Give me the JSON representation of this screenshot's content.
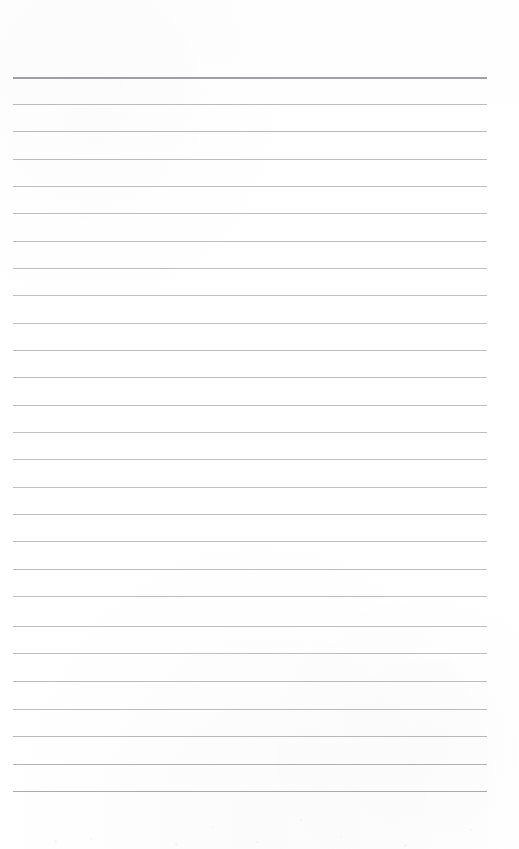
{
  "document": {
    "kind": "ruled-notebook-page",
    "title": "Blank ruled page",
    "text_content": "",
    "page_width": 519,
    "page_height": 849,
    "background_color": "#ffffff",
    "rule_color": "#b9bcc0",
    "header_rule_color": "#9ea2a7",
    "rule_left_x": 13,
    "rule_right_x": 487,
    "rule_count": 27,
    "rule_spacing": 27.4,
    "first_rule_y": 77,
    "last_rule_y": 791,
    "bottom_margin_height": 58,
    "rules": [
      {
        "index": 1,
        "y": 77,
        "weight": 2,
        "color": "#9ea2a7",
        "left": 13,
        "right": 487
      },
      {
        "index": 2,
        "y": 104,
        "weight": 1,
        "color": "#b9bcc0",
        "left": 13,
        "right": 487
      },
      {
        "index": 3,
        "y": 131,
        "weight": 1,
        "color": "#b9bcc0",
        "left": 13,
        "right": 487
      },
      {
        "index": 4,
        "y": 159,
        "weight": 1,
        "color": "#b9bcc0",
        "left": 13,
        "right": 487
      },
      {
        "index": 5,
        "y": 186,
        "weight": 1,
        "color": "#bcbfc3",
        "left": 13,
        "right": 487
      },
      {
        "index": 6,
        "y": 213,
        "weight": 1,
        "color": "#bcbfc3",
        "left": 13,
        "right": 487
      },
      {
        "index": 7,
        "y": 241,
        "weight": 1,
        "color": "#bcbfc3",
        "left": 13,
        "right": 487
      },
      {
        "index": 8,
        "y": 268,
        "weight": 1,
        "color": "#bcbfc3",
        "left": 13,
        "right": 487
      },
      {
        "index": 9,
        "y": 295,
        "weight": 1,
        "color": "#bcbfc3",
        "left": 13,
        "right": 487
      },
      {
        "index": 10,
        "y": 323,
        "weight": 1,
        "color": "#bcbfc3",
        "left": 13,
        "right": 487
      },
      {
        "index": 11,
        "y": 350,
        "weight": 1,
        "color": "#bcbfc3",
        "left": 13,
        "right": 487
      },
      {
        "index": 12,
        "y": 377,
        "weight": 1,
        "color": "#bcbfc3",
        "left": 13,
        "right": 487
      },
      {
        "index": 13,
        "y": 405,
        "weight": 1,
        "color": "#bcbfc3",
        "left": 13,
        "right": 487
      },
      {
        "index": 14,
        "y": 432,
        "weight": 1,
        "color": "#bcbfc3",
        "left": 13,
        "right": 487
      },
      {
        "index": 15,
        "y": 459,
        "weight": 1,
        "color": "#bcbfc3",
        "left": 13,
        "right": 487
      },
      {
        "index": 16,
        "y": 487,
        "weight": 1,
        "color": "#bcbfc3",
        "left": 13,
        "right": 487
      },
      {
        "index": 17,
        "y": 514,
        "weight": 1,
        "color": "#bcbfc3",
        "left": 13,
        "right": 487
      },
      {
        "index": 18,
        "y": 541,
        "weight": 1,
        "color": "#bcbfc3",
        "left": 13,
        "right": 487
      },
      {
        "index": 19,
        "y": 569,
        "weight": 1,
        "color": "#bcbfc3",
        "left": 13,
        "right": 487
      },
      {
        "index": 20,
        "y": 596,
        "weight": 1,
        "color": "#bcbfc3",
        "left": 13,
        "right": 487
      },
      {
        "index": 21,
        "y": 626,
        "weight": 1,
        "color": "#bcbfc3",
        "left": 13,
        "right": 487
      },
      {
        "index": 22,
        "y": 653,
        "weight": 1,
        "color": "#bcbfc3",
        "left": 13,
        "right": 487
      },
      {
        "index": 23,
        "y": 681,
        "weight": 1,
        "color": "#b9bcc0",
        "left": 13,
        "right": 487
      },
      {
        "index": 24,
        "y": 709,
        "weight": 1,
        "color": "#b9bcc0",
        "left": 13,
        "right": 487
      },
      {
        "index": 25,
        "y": 736,
        "weight": 1,
        "color": "#b6b9bd",
        "left": 13,
        "right": 487
      },
      {
        "index": 26,
        "y": 764,
        "weight": 1,
        "color": "#b0b3b7",
        "left": 13,
        "right": 487
      },
      {
        "index": 27,
        "y": 791,
        "weight": 1,
        "color": "#a9acb0",
        "left": 13,
        "right": 487
      }
    ],
    "specks": [
      {
        "x": 54,
        "y": 840,
        "size": 3
      },
      {
        "x": 90,
        "y": 838,
        "size": 2
      },
      {
        "x": 175,
        "y": 843,
        "size": 3
      },
      {
        "x": 256,
        "y": 841,
        "size": 2
      },
      {
        "x": 340,
        "y": 836,
        "size": 2
      },
      {
        "x": 404,
        "y": 844,
        "size": 3
      },
      {
        "x": 470,
        "y": 829,
        "size": 2
      },
      {
        "x": 212,
        "y": 826,
        "size": 2
      },
      {
        "x": 300,
        "y": 819,
        "size": 2
      }
    ]
  }
}
